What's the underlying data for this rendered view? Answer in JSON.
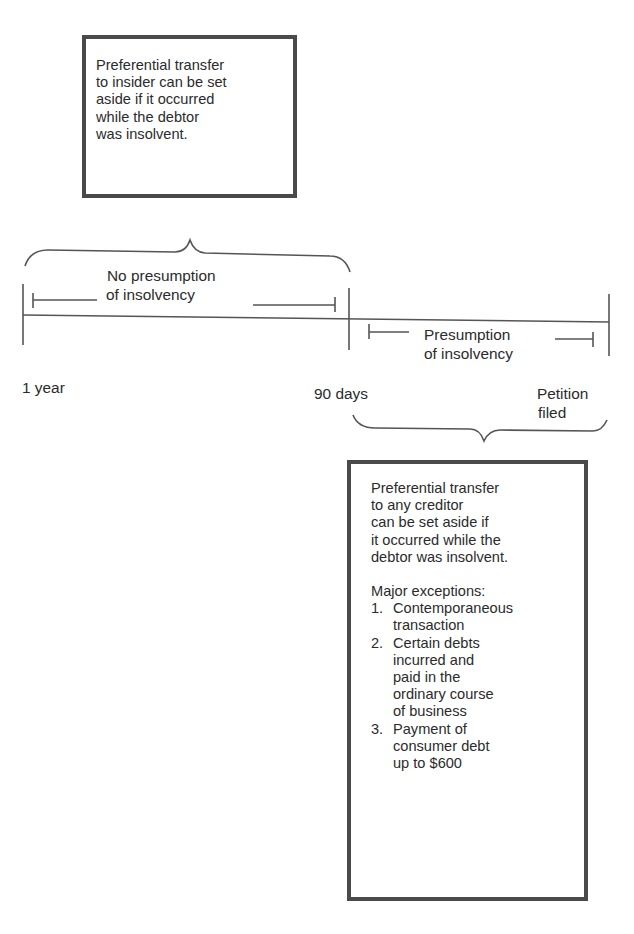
{
  "insider_box": {
    "lines": [
      "Preferential transfer",
      "to insider can be set",
      "aside if it occurred",
      "while the debtor",
      "was insolvent."
    ]
  },
  "timeline": {
    "markers": [
      {
        "label": "1 year"
      },
      {
        "label": "90 days"
      },
      {
        "label_lines": [
          "Petition",
          "filed"
        ]
      }
    ],
    "spans": [
      {
        "label_lines": [
          "No presumption",
          "of insolvency"
        ]
      },
      {
        "label_lines": [
          "Presumption",
          "of insolvency"
        ]
      }
    ]
  },
  "creditor_box": {
    "lines": [
      "Preferential transfer",
      "to any creditor",
      "can be set aside if",
      "it occurred while the",
      "debtor was insolvent."
    ],
    "exceptions_heading": "Major exceptions:",
    "exceptions": [
      {
        "num": "1.",
        "lines": [
          "Contemporaneous",
          "transaction"
        ]
      },
      {
        "num": "2.",
        "lines": [
          "Certain debts",
          "incurred and",
          "paid in the",
          "ordinary course",
          "of business"
        ]
      },
      {
        "num": "3.",
        "lines": [
          "Payment of",
          "consumer debt",
          "up to $600"
        ]
      }
    ]
  },
  "colors": {
    "ink": "#2b2b2b",
    "border": "#4a4a4a",
    "lines": "#555555"
  }
}
